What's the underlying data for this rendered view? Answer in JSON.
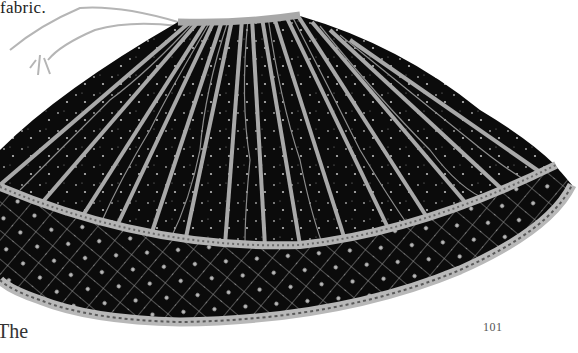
{
  "page": {
    "text_fragment_top": "fabric.",
    "text_fragment_bottom": "The",
    "page_number": "101"
  },
  "figure": {
    "colors": {
      "fabric": "#0b0b0b",
      "embroidery": "#bdbdbd",
      "waistband": "#a8a8a8",
      "background": "#ffffff"
    }
  }
}
